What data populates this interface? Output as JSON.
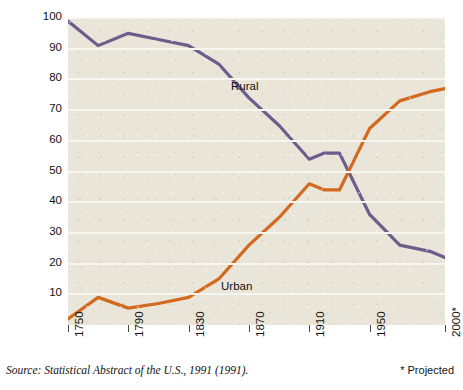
{
  "chart_data": {
    "type": "line",
    "title": "",
    "xlabel": "",
    "ylabel": "Percent of population",
    "xlim": [
      1750,
      2000
    ],
    "ylim": [
      0,
      100
    ],
    "grid": true,
    "legend_position": "inline-annotation",
    "xticks": [
      "1750",
      "1790",
      "1830",
      "1870",
      "1910",
      "1950",
      "2000*"
    ],
    "xtick_values": [
      1750,
      1790,
      1830,
      1870,
      1910,
      1950,
      2000
    ],
    "yticks": [
      "10",
      "20",
      "30",
      "40",
      "50",
      "60",
      "70",
      "80",
      "90",
      "100"
    ],
    "ytick_values": [
      10,
      20,
      30,
      40,
      50,
      60,
      70,
      80,
      90,
      100
    ],
    "series": [
      {
        "name": "Rural",
        "color": "#6d5c8c",
        "x": [
          1750,
          1770,
          1790,
          1810,
          1830,
          1850,
          1870,
          1890,
          1910,
          1920,
          1930,
          1950,
          1970,
          1990,
          2000
        ],
        "values": [
          99,
          91,
          95,
          93,
          91,
          85,
          74,
          65,
          54,
          56,
          56,
          36,
          26,
          24,
          22
        ]
      },
      {
        "name": "Urban",
        "color": "#d2691e",
        "x": [
          1750,
          1770,
          1790,
          1810,
          1830,
          1850,
          1870,
          1890,
          1910,
          1920,
          1930,
          1950,
          1970,
          1990,
          2000
        ],
        "values": [
          2,
          9,
          5.5,
          7,
          9,
          15,
          26,
          35,
          46,
          44,
          44,
          64,
          73,
          76,
          77
        ]
      }
    ],
    "annotations": [
      {
        "text": "Rural",
        "x": 1845,
        "y": 80
      },
      {
        "text": "Urban",
        "x": 1838,
        "y": 17
      }
    ]
  },
  "footer": {
    "source": "Source: Statistical Abstract of the U.S., 1991 (1991).",
    "projected_note": "* Projected"
  }
}
